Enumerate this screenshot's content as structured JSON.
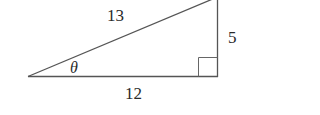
{
  "diagram": {
    "type": "right-triangle",
    "labels": {
      "hypotenuse": "13",
      "opposite": "5",
      "adjacent": "12",
      "angle": "θ"
    },
    "stroke_color": "#555555",
    "text_color": "#2a2a2a",
    "right_angle_marker": true
  }
}
